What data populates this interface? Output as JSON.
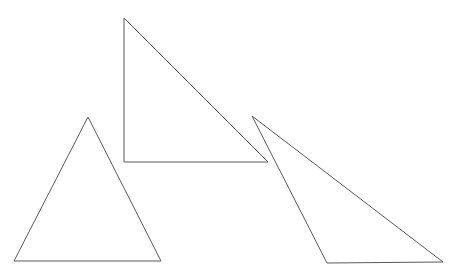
{
  "canvas": {
    "width": 456,
    "height": 280,
    "background_color": "#ffffff",
    "description": "Line drawing of three unfilled triangle outlines on a plain white background"
  },
  "style": {
    "stroke_color": "#5a5a5a",
    "stroke_width": 1,
    "fill": "none"
  },
  "chart_data": {
    "type": "diagram",
    "title": "",
    "shape_count": 3,
    "shapes": [
      {
        "id": "triangle-left",
        "name": "left-isosceles-triangle",
        "kind": "triangle",
        "orientation": "apex-up",
        "points": "88,117 14,261 161,261",
        "vertices": [
          {
            "label": "apex",
            "x": 88,
            "y": 117
          },
          {
            "label": "bottom-left",
            "x": 14,
            "y": 261
          },
          {
            "label": "bottom-right",
            "x": 161,
            "y": 261
          }
        ],
        "base_width": 147,
        "height": 144,
        "stroke_color": "#5a5a5a",
        "fill": "none"
      },
      {
        "id": "triangle-middle",
        "name": "middle-right-triangle",
        "kind": "triangle",
        "orientation": "right-angle-bottom-left",
        "points": "124,18 124,162 268,162",
        "vertices": [
          {
            "label": "top",
            "x": 124,
            "y": 18
          },
          {
            "label": "right-angle",
            "x": 124,
            "y": 162
          },
          {
            "label": "bottom-right",
            "x": 268,
            "y": 162
          }
        ],
        "base_width": 144,
        "height": 144,
        "stroke_color": "#5a5a5a",
        "fill": "none"
      },
      {
        "id": "triangle-right",
        "name": "right-obtuse-triangle",
        "kind": "triangle",
        "orientation": "apex-upper-left",
        "points": "252,116 327,263 443,262",
        "vertices": [
          {
            "label": "apex",
            "x": 252,
            "y": 116
          },
          {
            "label": "bottom-left",
            "x": 327,
            "y": 263
          },
          {
            "label": "bottom-right",
            "x": 443,
            "y": 262
          }
        ],
        "base_width": 116,
        "height": 147,
        "stroke_color": "#5a5a5a",
        "fill": "none"
      }
    ]
  }
}
